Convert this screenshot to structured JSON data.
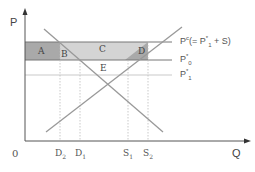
{
  "diagram": {
    "axes": {
      "y_label": "P",
      "x_label": "Q",
      "origin_label": "0"
    },
    "price_lines": {
      "pc": {
        "main": "P",
        "sup": "c",
        "rest_open": "(= P",
        "sub1": "1",
        "sup1": "*",
        "rest_close": " + S)"
      },
      "p0": {
        "main": "P",
        "sub": "0",
        "sup": "*"
      },
      "p1": {
        "main": "P",
        "sub": "1",
        "sup": "*"
      }
    },
    "regions": {
      "a": "A",
      "b": "B",
      "c": "C",
      "d": "D",
      "e": "E"
    },
    "quantity_ticks": {
      "d2": {
        "main": "D",
        "sub": "2"
      },
      "d1": {
        "main": "D",
        "sub": "1"
      },
      "s1": {
        "main": "S",
        "sub": "1"
      },
      "s2": {
        "main": "S",
        "sub": "2"
      }
    },
    "colors": {
      "axis": "#555555",
      "curve": "#999999",
      "dark_shade": "#a9a9a9",
      "light_shade": "#d4d4d4",
      "price_line": "#777777",
      "dotted": "#bbbbbb"
    }
  }
}
